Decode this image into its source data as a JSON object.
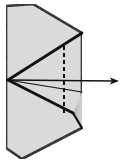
{
  "figure": {
    "title": "paper-folding-step-diagram",
    "canvas": {
      "width": 123,
      "height": 166
    },
    "colors": {
      "paper_fill": "#dcdcda",
      "paper_fill_shadow": "#c7c7c4",
      "outline": "#111111",
      "crease": "#111111",
      "dashed_fold": "#111111",
      "arrow": "#111111",
      "background": "#ffffff"
    },
    "shapes": {
      "outer_outline": {
        "name": "folded-paper-outline",
        "points": "6,6 33,4 82,33 82,128 22,159 6,148"
      },
      "upper_triangle": {
        "name": "upper-crease-triangle",
        "points": "8,80 82,33 82,92"
      },
      "lower_triangle": {
        "name": "lower-crease-triangle",
        "points": "8,80 73,113 82,128"
      },
      "shadow_wedge": {
        "name": "right-shadow-wedge",
        "points": "73,113 82,92 82,128"
      }
    },
    "lines": {
      "crease_upper": {
        "name": "crease-line-upper",
        "x1": 8,
        "y1": 80,
        "x2": 82,
        "y2": 33
      },
      "crease_lower": {
        "name": "crease-line-lower",
        "x1": 8,
        "y1": 80,
        "x2": 73,
        "y2": 113
      },
      "crease_lower_tail": {
        "name": "crease-line-lower-tail",
        "x1": 73,
        "y1": 113,
        "x2": 82,
        "y2": 128
      },
      "crease_mid_horizontal": {
        "name": "crease-line-horizontal",
        "x1": 8,
        "y1": 80,
        "x2": 82,
        "y2": 92
      }
    },
    "dashed_fold_line": {
      "name": "dashed-fold-line",
      "x": 64,
      "y_top": 46,
      "y_bottom": 116,
      "dash_pattern": "4,3",
      "stroke_width": 2
    },
    "arrow": {
      "name": "fold-direction-arrow",
      "label": "",
      "x_start": 9,
      "y_start": 80,
      "x_end": 119,
      "y_end": 81,
      "head_length": 9,
      "head_width": 7,
      "direction": "right"
    }
  }
}
